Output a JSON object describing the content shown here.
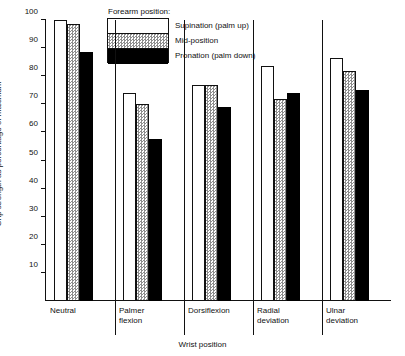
{
  "chart_data": {
    "type": "bar",
    "title": "",
    "xlabel": "Wrist position",
    "ylabel": "Grip strength as percentage of maximum",
    "ylim": [
      0,
      100
    ],
    "yticks": [
      10,
      20,
      30,
      40,
      50,
      60,
      70,
      80,
      90,
      100
    ],
    "grid": false,
    "legend_title": "Forearm position:",
    "legend_position": "top-center",
    "categories": [
      "Neutral",
      "Palmer\nflexion",
      "Dorsiflexion",
      "Radial\ndeviation",
      "Ulnar\ndeviation"
    ],
    "series": [
      {
        "name": "Supination (palm up)",
        "fill": "white",
        "color": "#ffffff",
        "values": [
          100,
          74,
          77,
          83.5,
          86.5
        ]
      },
      {
        "name": "Mid-position",
        "fill": "stipple",
        "color": "#c8c8c8",
        "values": [
          98.5,
          70,
          77,
          72,
          82
        ]
      },
      {
        "name": "Pronation (palm down)",
        "fill": "solid",
        "color": "#000000",
        "values": [
          88.5,
          57.5,
          69,
          74,
          75
        ]
      }
    ]
  }
}
